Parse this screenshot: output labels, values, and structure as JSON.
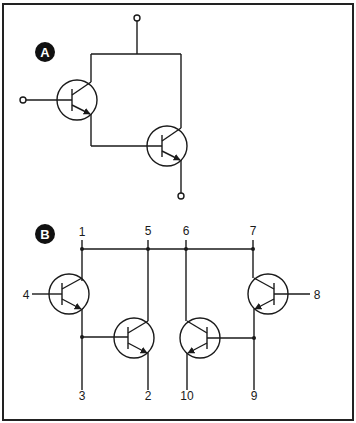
{
  "figure": {
    "panels": [
      {
        "id": "A",
        "badge": "A",
        "description": "Darlington pair of two NPN transistors with common collector"
      },
      {
        "id": "B",
        "badge": "B",
        "description": "Transistor array with numbered pins",
        "pins": {
          "top": [
            "1",
            "5",
            "6",
            "7"
          ],
          "left": "4",
          "right": "8",
          "bottom": [
            "3",
            "2",
            "10",
            "9"
          ]
        }
      }
    ]
  },
  "colors": {
    "line": "#1a1a1a",
    "background": "#ffffff",
    "badge": "#111111"
  }
}
